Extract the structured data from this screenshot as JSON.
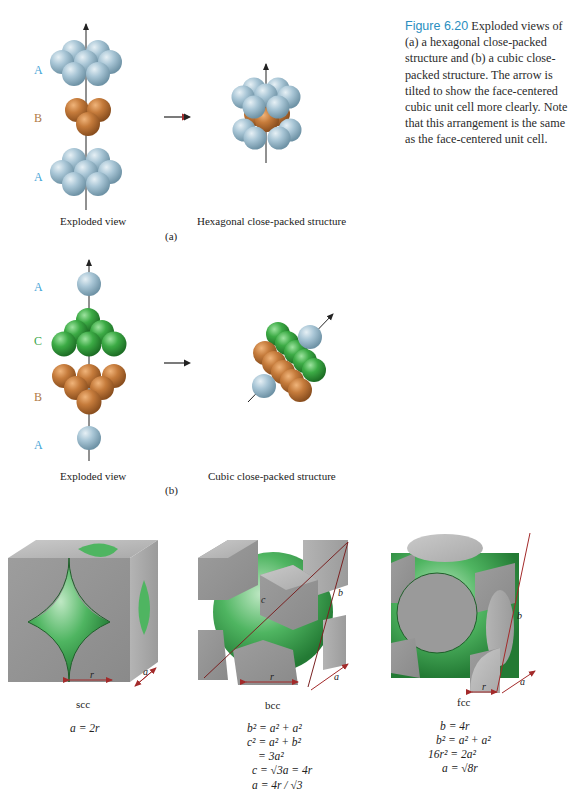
{
  "caption": {
    "figure_label": "Figure 6.20",
    "text": "Exploded views of (a) a hexagonal close-packed structure and (b) a cubic close-packed structure. The arrow is tilted to show the face-centered cubic unit cell more clearly. Note that this arrangement is the same as the face-centered unit cell."
  },
  "panel_a": {
    "label": "(a)",
    "layers": [
      "A",
      "B",
      "A"
    ],
    "left_caption": "Exploded view",
    "right_caption": "Hexagonal close-packed structure"
  },
  "panel_b": {
    "label": "(b)",
    "layers": [
      "A",
      "C",
      "B",
      "A"
    ],
    "left_caption": "Exploded view",
    "right_caption": "Cubic close-packed structure"
  },
  "unit_cells": [
    {
      "name": "scc",
      "dims": {
        "r": "r",
        "a": "a"
      },
      "equations": [
        "a = 2r"
      ]
    },
    {
      "name": "bcc",
      "dims": {
        "r": "r",
        "a": "a",
        "b": "b",
        "c": "c"
      },
      "equations": [
        "b² = a² + a²",
        "c² = a² + b²",
        "= 3a²",
        "c = √3a = 4r",
        "a = 4r / √3"
      ]
    },
    {
      "name": "fcc",
      "dims": {
        "r": "r",
        "a": "a",
        "b": "b"
      },
      "equations": [
        "b = 4r",
        "b² = a² + a²",
        "16r² = 2a²",
        "a = √8r"
      ]
    }
  ],
  "colors": {
    "layer_A": "#9fc0d2",
    "layer_B": "#c27a3a",
    "layer_C": "#3aa64a",
    "caption_accent": "#2a8ec0",
    "dimension_line": "#a32a2a",
    "cube_gray": "#9a9a9a"
  }
}
